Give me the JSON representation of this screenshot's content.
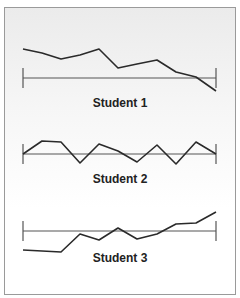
{
  "chart_data": {
    "type": "line",
    "title": "",
    "xlabel": "",
    "ylabel": "",
    "grid": false,
    "legend": "none",
    "panels": [
      {
        "name": "Student 1",
        "baseline_y": 78,
        "baseline_x": [
          23,
          216
        ],
        "points": [
          [
            23,
            49
          ],
          [
            42,
            53
          ],
          [
            61,
            59
          ],
          [
            80,
            55
          ],
          [
            99,
            49
          ],
          [
            118,
            68
          ],
          [
            137,
            64
          ],
          [
            157,
            60
          ],
          [
            176,
            72
          ],
          [
            196,
            77
          ],
          [
            216,
            91
          ]
        ],
        "trend": "decreasing"
      },
      {
        "name": "Student 2",
        "baseline_y": 154,
        "baseline_x": [
          23,
          216
        ],
        "points": [
          [
            23,
            154
          ],
          [
            42,
            141
          ],
          [
            61,
            142
          ],
          [
            80,
            163
          ],
          [
            99,
            144
          ],
          [
            118,
            151
          ],
          [
            137,
            162
          ],
          [
            157,
            145
          ],
          [
            176,
            164
          ],
          [
            196,
            142
          ],
          [
            216,
            154
          ]
        ],
        "trend": "variable"
      },
      {
        "name": "Student 3",
        "baseline_y": 231,
        "baseline_x": [
          23,
          216
        ],
        "points": [
          [
            23,
            250
          ],
          [
            61,
            252
          ],
          [
            80,
            234
          ],
          [
            99,
            240
          ],
          [
            118,
            228
          ],
          [
            137,
            239
          ],
          [
            157,
            234
          ],
          [
            176,
            224
          ],
          [
            196,
            223
          ],
          [
            216,
            212
          ]
        ],
        "trend": "increasing"
      }
    ]
  },
  "labels": {
    "student1": "Student 1",
    "student2": "Student 2",
    "student3": "Student 3"
  },
  "colors": {
    "line": "#2a2a2a",
    "baseline": "#555555",
    "border": "#9a9a9a"
  }
}
